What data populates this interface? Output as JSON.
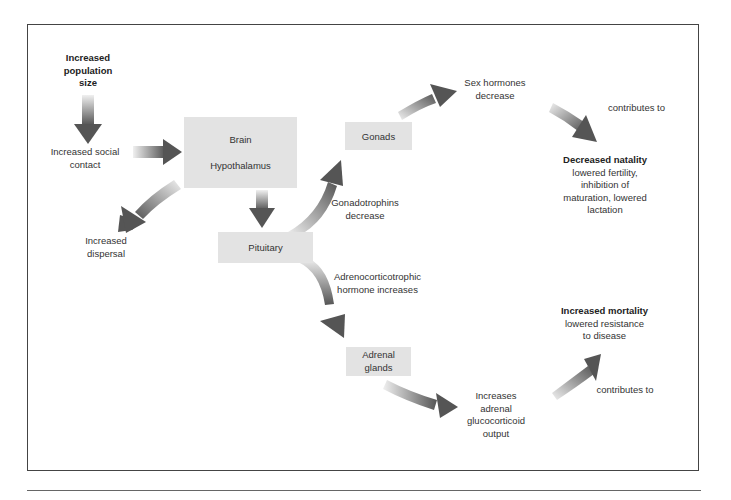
{
  "diagram": {
    "nodes": {
      "population": {
        "label": [
          "Increased",
          "population",
          "size"
        ],
        "bold": true
      },
      "social_contact": {
        "label": [
          "Increased social",
          "contact"
        ]
      },
      "brain": {
        "label_top": "Brain",
        "label_bottom": "Hypothalamus"
      },
      "dispersal": {
        "label": [
          "Increased",
          "dispersal"
        ]
      },
      "pituitary": {
        "label": "Pituitary"
      },
      "gonads": {
        "label": "Gonads"
      },
      "sex_hormones": {
        "label": [
          "Sex hormones",
          "decrease"
        ]
      },
      "gonadotrophins": {
        "label": [
          "Gonadotrophins",
          "decrease"
        ]
      },
      "acth": {
        "label": [
          "Adrenocorticotrophic",
          "hormone increases"
        ]
      },
      "adrenal": {
        "label": [
          "Adrenal",
          "glands"
        ]
      },
      "glucocorticoid": {
        "label": [
          "Increases",
          "adrenal",
          "glucocorticoid",
          "output"
        ]
      },
      "natality": {
        "title": "Decreased natality",
        "detail": [
          "lowered fertility,",
          "inhibition of",
          "maturation, lowered",
          "lactation"
        ]
      },
      "mortality": {
        "title": "Increased mortality",
        "detail": [
          "lowered resistance",
          "to disease"
        ]
      },
      "contributes_1": {
        "label": "contributes to"
      },
      "contributes_2": {
        "label": "contributes to"
      }
    },
    "colors": {
      "box": "#e3e3e3",
      "arrow_dark": "#555555",
      "arrow_light": "#e8e8e8",
      "frame": "#444444"
    }
  }
}
